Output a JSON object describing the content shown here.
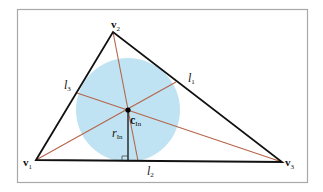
{
  "diagram": {
    "colors": {
      "frame": "#a8a8a8",
      "triangle_edges": "#111111",
      "cevians": "#b5654a",
      "incircle_fill": "#bfe3f2",
      "radius": "#111111",
      "center_dot": "#000000"
    },
    "vertices": [
      {
        "id": "v1",
        "label": "v",
        "sub": "1",
        "x": 36,
        "y": 160
      },
      {
        "id": "v2",
        "label": "v",
        "sub": "2",
        "x": 113,
        "y": 32
      },
      {
        "id": "v3",
        "label": "v",
        "sub": "3",
        "x": 282,
        "y": 162
      }
    ],
    "incenter": {
      "label": "c",
      "sub": "In",
      "x": 128,
      "y": 110
    },
    "inradius": {
      "label": "r",
      "sub": "In",
      "value_px": 51
    },
    "edge_labels": [
      {
        "id": "l1",
        "label": "l",
        "sub": "1"
      },
      {
        "id": "l2",
        "label": "l",
        "sub": "2"
      },
      {
        "id": "l3",
        "label": "l",
        "sub": "3"
      }
    ]
  }
}
